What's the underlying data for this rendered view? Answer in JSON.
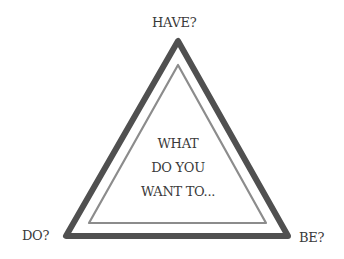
{
  "diagram": {
    "vertices": {
      "top": "HAVE?",
      "bottom_left": "DO?",
      "bottom_right": "BE?"
    },
    "center_lines": [
      "WHAT",
      "DO YOU",
      "WANT TO..."
    ],
    "colors": {
      "outer_triangle": "#505050",
      "inner_triangle": "#8c8c8c",
      "text": "#3a3a3a",
      "background": "#ffffff"
    }
  }
}
